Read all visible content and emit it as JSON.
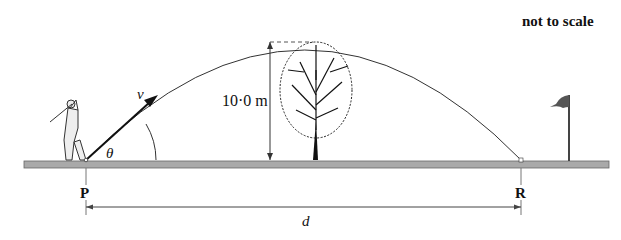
{
  "diagram": {
    "note": "not to scale",
    "height_label": "10·0 m",
    "velocity_label": "v",
    "angle_label": "θ",
    "point_start_label": "P",
    "point_end_label": "R",
    "distance_label": "d",
    "colors": {
      "ground_fill": "#a9a9a9",
      "ground_stroke": "#555555",
      "line": "#222222",
      "flag": "#555555"
    },
    "elements": [
      {
        "name": "golfer",
        "description": "golfer mid-swing at point P"
      },
      {
        "name": "trajectory",
        "description": "parabolic ball path from P to R"
      },
      {
        "name": "tree",
        "description": "tree near apex of trajectory"
      },
      {
        "name": "flag",
        "description": "golf flag beyond R"
      }
    ]
  }
}
